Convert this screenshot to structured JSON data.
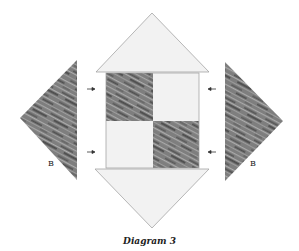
{
  "caption": "Diagram 3",
  "labels": {
    "left_piece": "B",
    "right_piece": "B"
  },
  "colors": {
    "light_fabric": "#f2f2f2",
    "dark_fabric_base": "#7e7e7e",
    "dark_streak": "#555555",
    "light_streak": "#a8a8a8",
    "outline": "#9a9a9a",
    "arrow": "#333333"
  },
  "pieces": [
    {
      "name": "top-triangle",
      "fabric": "light"
    },
    {
      "name": "center-four-patch",
      "fabric": "mixed"
    },
    {
      "name": "bottom-triangle",
      "fabric": "light"
    },
    {
      "name": "left-triangle-b",
      "fabric": "dark"
    },
    {
      "name": "right-triangle-b",
      "fabric": "dark"
    }
  ],
  "arrows": [
    {
      "side": "left",
      "direction": "right",
      "count": 2
    },
    {
      "side": "right",
      "direction": "left",
      "count": 2
    }
  ]
}
